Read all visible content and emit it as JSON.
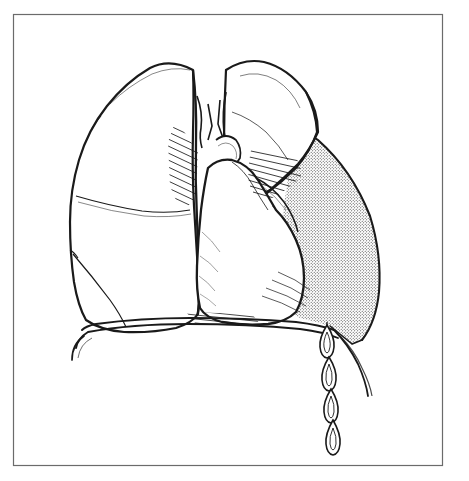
{
  "figure": {
    "kind": "anatomical-line-drawing",
    "title": "Anterior view of the thorax showing lungs, heart and a stippled pleural effusion with draining fluid droplets",
    "caption": "",
    "labels": [],
    "annotations": [],
    "background_color": "#ffffff",
    "ink_color": "#1a1a1a",
    "border": {
      "color": "#6b6b6b",
      "width_px": 1,
      "inset": {
        "left": 13,
        "top": 14,
        "right": 443,
        "bottom": 466
      }
    },
    "regions": [
      {
        "name": "left-lung",
        "description": "Patient's right lung (viewer left), upper and lower lobes divided by an oblique fissure",
        "fill": "#ffffff",
        "stroke": "#1a1a1a"
      },
      {
        "name": "right-lung",
        "description": "Patient's left lung (viewer right), collapsed / retracted upper lobe",
        "fill": "#ffffff",
        "stroke": "#1a1a1a"
      },
      {
        "name": "heart",
        "description": "Cardiac silhouette occupying the central mediastinum",
        "fill": "#ffffff",
        "stroke": "#1a1a1a"
      },
      {
        "name": "pleural-effusion",
        "description": "Stippled crescent of pleural fluid in the right hemithorax",
        "fill": "stipple-dots",
        "stroke": "#1a1a1a",
        "dot_color": "#2a2a2a",
        "dot_spacing_px": 3
      },
      {
        "name": "diaphragm",
        "description": "Double-line diaphragmatic dome sweeping across the base of the thorax",
        "stroke": "#1a1a1a"
      },
      {
        "name": "fluid-droplets",
        "description": "Vertical chain of four teardrop shapes draining below the diaphragm",
        "count": 4,
        "stroke": "#1a1a1a"
      },
      {
        "name": "hatching-mediastinal",
        "description": "Short parallel hatch strokes along the mediastinal pleural edges",
        "stroke": "#1a1a1a"
      }
    ]
  }
}
